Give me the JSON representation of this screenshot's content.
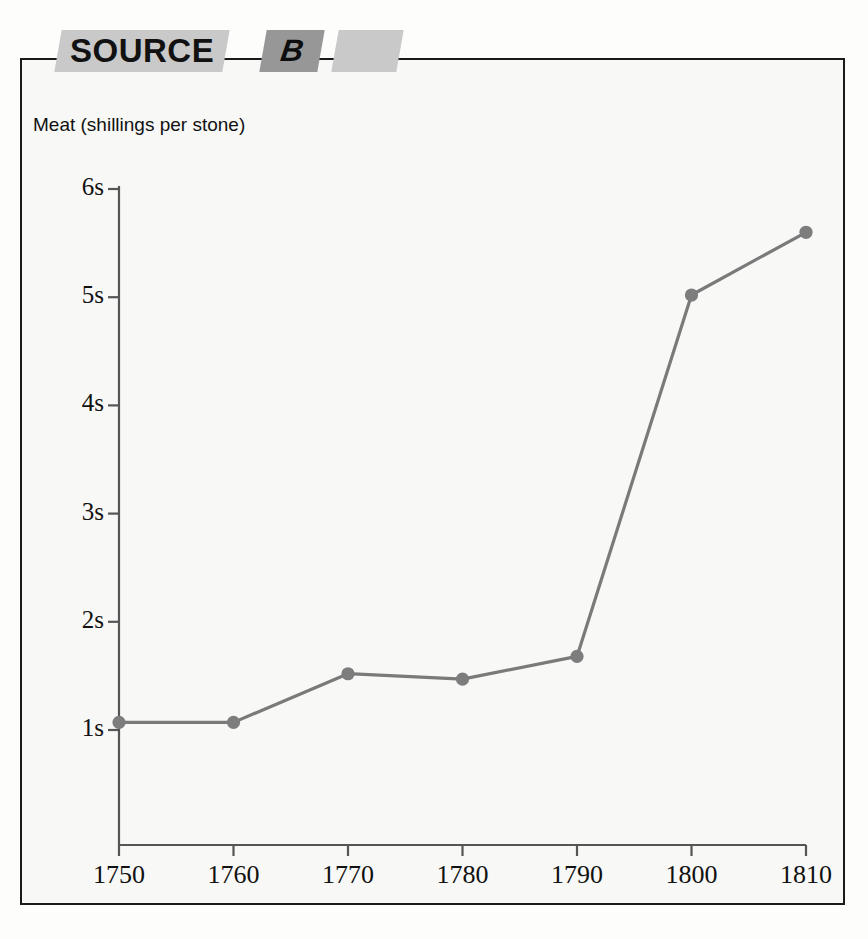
{
  "banner": {
    "source_label": "SOURCE",
    "letter_label": "B",
    "blank_label": ""
  },
  "chart_data": {
    "type": "line",
    "title": "Meat (shillings per stone)",
    "xlabel": "",
    "ylabel": "Meat (shillings per stone)",
    "categories": [
      "1750",
      "1760",
      "1770",
      "1780",
      "1790",
      "1800",
      "1810"
    ],
    "x": [
      1750,
      1760,
      1770,
      1780,
      1790,
      1800,
      1810
    ],
    "values": [
      1.07,
      1.07,
      1.52,
      1.47,
      1.68,
      5.02,
      5.6
    ],
    "ytick_labels": [
      "1s",
      "2s",
      "3s",
      "4s",
      "5s",
      "6s"
    ],
    "ytick_values": [
      1,
      2,
      3,
      4,
      5,
      6
    ],
    "xtick_labels": [
      "1750",
      "1760",
      "1770",
      "1780",
      "1790",
      "1800",
      "1810"
    ],
    "ylim": [
      0.45,
      6
    ],
    "xlim": [
      1750,
      1810
    ],
    "grid": false,
    "legend": null,
    "line_color": "#7a7a7a",
    "marker_color": "#7d7d7d",
    "axis_color": "#555555"
  }
}
